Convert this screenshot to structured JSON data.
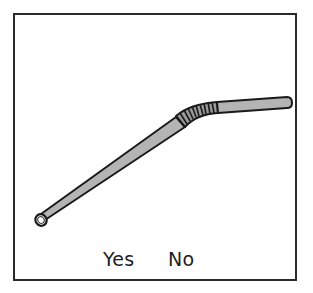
{
  "illustration": {
    "subject": "bent drinking straw",
    "colors": {
      "frame": "#2a2a2a",
      "straw_fill": "#b4b4b4",
      "straw_outline": "#1a1a1a",
      "background": "#ffffff"
    }
  },
  "options": [
    {
      "label": "Yes"
    },
    {
      "label": "No"
    }
  ]
}
